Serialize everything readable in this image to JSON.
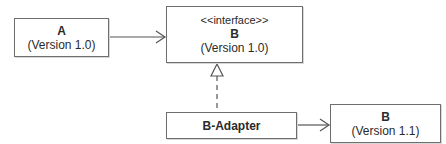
{
  "diagram": {
    "type": "UML class diagram - Adapter pattern",
    "nodes": [
      {
        "id": "a",
        "name": "A",
        "version": "(Version 1.0)"
      },
      {
        "id": "b",
        "stereotype": "<<interface>>",
        "name": "B",
        "version": "(Version 1.0)"
      },
      {
        "id": "adapter",
        "name": "B-Adapter"
      },
      {
        "id": "b11",
        "name": "B",
        "version": "(Version 1.1)"
      }
    ],
    "edges": [
      {
        "from": "a",
        "to": "b",
        "kind": "association"
      },
      {
        "from": "adapter",
        "to": "b",
        "kind": "realization"
      },
      {
        "from": "adapter",
        "to": "b11",
        "kind": "association"
      }
    ]
  },
  "colors": {
    "line": "#555555",
    "border": "#6e6e6e",
    "text": "#2a2a2a"
  }
}
